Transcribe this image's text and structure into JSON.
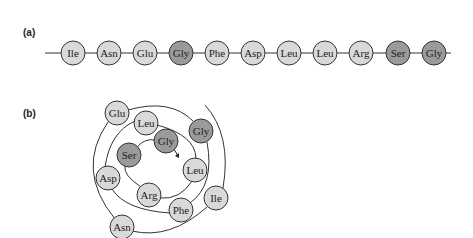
{
  "panel_a": {
    "label": "(a)",
    "sequence": [
      {
        "name": "Ile",
        "shade": "light"
      },
      {
        "name": "Asn",
        "shade": "light"
      },
      {
        "name": "Glu",
        "shade": "light"
      },
      {
        "name": "Gly",
        "shade": "dark"
      },
      {
        "name": "Phe",
        "shade": "light"
      },
      {
        "name": "Asp",
        "shade": "light"
      },
      {
        "name": "Leu",
        "shade": "light"
      },
      {
        "name": "Leu",
        "shade": "light"
      },
      {
        "name": "Arg",
        "shade": "light"
      },
      {
        "name": "Ser",
        "shade": "dark"
      },
      {
        "name": "Gly",
        "shade": "dark"
      }
    ]
  },
  "panel_b": {
    "label": "(b)",
    "residues": [
      {
        "name": "Glu",
        "shade": "light"
      },
      {
        "name": "Leu",
        "shade": "light"
      },
      {
        "name": "Gly",
        "shade": "dark"
      },
      {
        "name": "Gly",
        "shade": "dark"
      },
      {
        "name": "Ser",
        "shade": "dark"
      },
      {
        "name": "Leu",
        "shade": "light"
      },
      {
        "name": "Asp",
        "shade": "light"
      },
      {
        "name": "Arg",
        "shade": "light"
      },
      {
        "name": "Phe",
        "shade": "light"
      },
      {
        "name": "Ile",
        "shade": "light"
      },
      {
        "name": "Asn",
        "shade": "light"
      }
    ]
  },
  "colors": {
    "light_fill": "#d9d9d9",
    "dark_fill": "#9a9a9a",
    "stroke": "#333333"
  }
}
